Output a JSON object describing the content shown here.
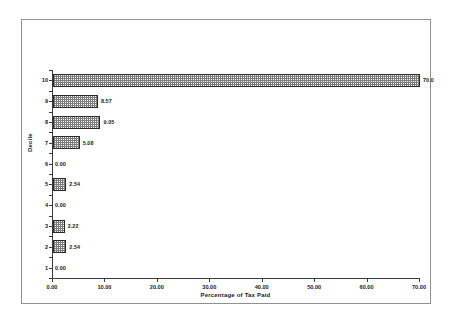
{
  "chart_data": {
    "type": "bar",
    "orientation": "horizontal",
    "title": "",
    "xlabel": "Percentage of Tax Paid",
    "ylabel": "Decile",
    "xlim": [
      0,
      70
    ],
    "ylim": [
      1,
      10
    ],
    "grid": false,
    "legend": false,
    "xticks": [
      0,
      10,
      20,
      30,
      40,
      50,
      60,
      70
    ],
    "xtick_labels": [
      "0.00",
      "10.00",
      "20.00",
      "30.00",
      "40.00",
      "50.00",
      "60.00",
      "70.00"
    ],
    "categories": [
      "1",
      "2",
      "3",
      "4",
      "5",
      "6",
      "7",
      "8",
      "9",
      "10"
    ],
    "values": [
      0.0,
      2.54,
      2.22,
      0.0,
      2.54,
      0.0,
      5.08,
      9.05,
      8.57,
      70.0
    ],
    "data_labels": [
      "0.00",
      "2.54",
      "2.22",
      "0.00",
      "2.54",
      "0.00",
      "5.08",
      "9.05",
      "8.57",
      "70.0"
    ],
    "bars": [
      {
        "category": "10",
        "value": 70.0,
        "label": "70.0"
      },
      {
        "category": "9",
        "value": 8.57,
        "label": "8.57"
      },
      {
        "category": "8",
        "value": 9.05,
        "label": "9.05"
      },
      {
        "category": "7",
        "value": 5.08,
        "label": "5.08"
      },
      {
        "category": "6",
        "value": 0.0,
        "label": "0.00"
      },
      {
        "category": "5",
        "value": 2.54,
        "label": "2.54"
      },
      {
        "category": "4",
        "value": 0.0,
        "label": "0.00"
      },
      {
        "category": "3",
        "value": 2.22,
        "label": "2.22"
      },
      {
        "category": "2",
        "value": 2.54,
        "label": "2.54"
      },
      {
        "category": "1",
        "value": 0.0,
        "label": "0.00"
      }
    ],
    "colors": {
      "bar_fill": "#f4f4f4",
      "bar_pattern": "#7d7d7d",
      "bar_border": "#2b2b2b",
      "axis": "#3a3a3a",
      "text": "#1a1a1a",
      "frame": "#8f8f8f",
      "background": "#ffffff"
    }
  }
}
